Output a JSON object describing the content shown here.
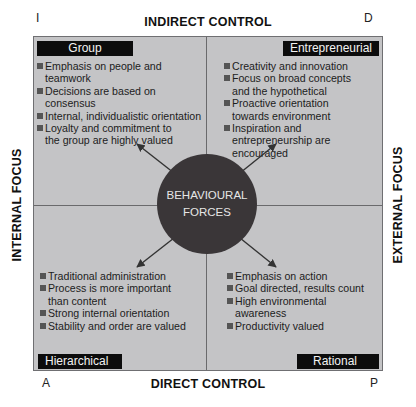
{
  "corners": {
    "top_left": "I",
    "top_right": "D",
    "bottom_left": "A",
    "bottom_right": "P"
  },
  "axes": {
    "top": "INDIRECT CONTROL",
    "bottom": "DIRECT CONTROL",
    "left": "INTERNAL FOCUS",
    "right": "EXTERNAL FOCUS"
  },
  "center": {
    "line1": "BEHAVIOURAL",
    "line2": "FORCES",
    "arrows": [
      "up-left",
      "up-right",
      "down-left",
      "down-right"
    ]
  },
  "quadrants": {
    "top_left": {
      "title": "Group",
      "items": [
        "Emphasis on people and teamwork",
        "Decisions are based on consensus",
        "Internal, individualistic orientation",
        "Loyalty and commitment to the group are highly valued"
      ]
    },
    "top_right": {
      "title": "Entrepreneurial",
      "items": [
        "Creativity and innovation",
        "Focus on broad concepts and the hypothetical",
        "Proactive orientation towards environment",
        "Inspiration and entrepreneurship are encouraged"
      ]
    },
    "bottom_left": {
      "title": "Hierarchical",
      "items": [
        "Traditional administration",
        "Process is more important than content",
        "Strong internal orientation",
        "Stability and order are valued"
      ]
    },
    "bottom_right": {
      "title": "Rational",
      "items": [
        "Emphasis on action",
        "Goal directed, results count",
        "High environmental awareness",
        "Productivity valued"
      ]
    }
  },
  "colors": {
    "panel": "#c4c4c6",
    "title_bg": "#0c0c0c",
    "circle": "#3a3638",
    "bullet": "#555555"
  }
}
